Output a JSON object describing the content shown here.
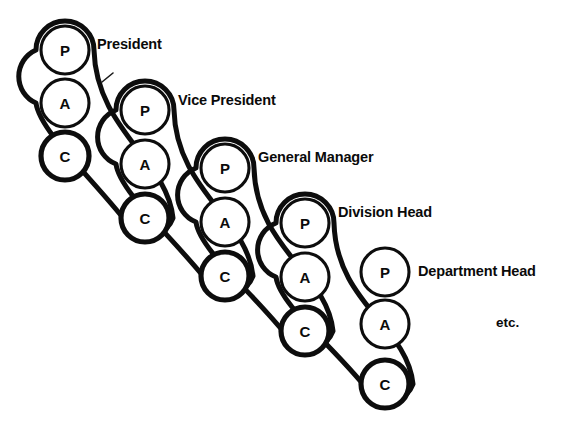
{
  "diagram": {
    "background_color": "#ffffff",
    "ink_color": "#0d0d0d",
    "node_letters": {
      "president": "P",
      "assistant": "A",
      "cascade": "C"
    },
    "trailing_note": "etc.",
    "groups": [
      {
        "id": "group-president",
        "label": "President",
        "label_x": 97,
        "label_y": 44,
        "center_x": 65,
        "p_y": 50,
        "a_y": 103,
        "c_y": 156,
        "radius": 24,
        "has_capsule": true,
        "has_leader_line": true,
        "leader": {
          "x1": 102,
          "y1": 82,
          "x2": 113,
          "y2": 73
        },
        "nodes": [
          {
            "letter": "P",
            "name": "node-president-p"
          },
          {
            "letter": "A",
            "name": "node-president-a"
          },
          {
            "letter": "C",
            "name": "node-president-c"
          }
        ]
      },
      {
        "id": "group-vice-president",
        "label": "Vice President",
        "label_x": 178,
        "label_y": 100,
        "center_x": 145,
        "p_y": 110,
        "a_y": 164,
        "c_y": 218,
        "radius": 24,
        "has_capsule": true,
        "has_leader_line": false,
        "nodes": [
          {
            "letter": "P",
            "name": "node-vice-president-p"
          },
          {
            "letter": "A",
            "name": "node-vice-president-a"
          },
          {
            "letter": "C",
            "name": "node-vice-president-c"
          }
        ]
      },
      {
        "id": "group-general-manager",
        "label": "General Manager",
        "label_x": 258,
        "label_y": 157,
        "center_x": 225,
        "p_y": 168,
        "a_y": 222,
        "c_y": 276,
        "radius": 24,
        "has_capsule": true,
        "has_leader_line": false,
        "nodes": [
          {
            "letter": "P",
            "name": "node-general-manager-p"
          },
          {
            "letter": "A",
            "name": "node-general-manager-a"
          },
          {
            "letter": "C",
            "name": "node-general-manager-c"
          }
        ]
      },
      {
        "id": "group-division-head",
        "label": "Division Head",
        "label_x": 338,
        "label_y": 212,
        "center_x": 305,
        "p_y": 223,
        "a_y": 277,
        "c_y": 331,
        "radius": 24,
        "has_capsule": true,
        "has_leader_line": false,
        "nodes": [
          {
            "letter": "P",
            "name": "node-division-head-p"
          },
          {
            "letter": "A",
            "name": "node-division-head-a"
          },
          {
            "letter": "C",
            "name": "node-division-head-c"
          }
        ]
      },
      {
        "id": "group-department-head",
        "label": "Department Head",
        "label_x": 418,
        "label_y": 271,
        "center_x": 385,
        "p_y": 272,
        "a_y": 324,
        "c_y": 384,
        "radius": 24,
        "has_capsule": false,
        "has_leader_line": false,
        "nodes": [
          {
            "letter": "P",
            "name": "node-department-head-p"
          },
          {
            "letter": "A",
            "name": "node-department-head-a"
          },
          {
            "letter": "C",
            "name": "node-department-head-c"
          }
        ]
      }
    ],
    "etc_note": {
      "text": "etc.",
      "x": 496,
      "y": 322
    }
  }
}
